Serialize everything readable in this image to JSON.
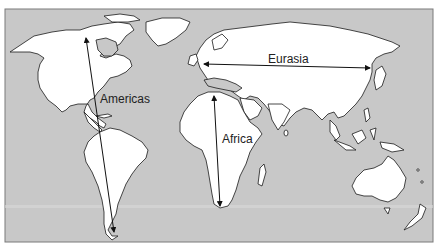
{
  "diagram": {
    "type": "world-map-continental-axes",
    "colors": {
      "ocean": "#c8c8c8",
      "land": "#ffffff",
      "coast": "#1a1a1a",
      "border": "#7a7a7a",
      "arrow": "#111111",
      "label": "#222222"
    },
    "axes": [
      {
        "id": "americas",
        "label": "Americas",
        "orientation": "north-south"
      },
      {
        "id": "eurasia",
        "label": "Eurasia",
        "orientation": "east-west"
      },
      {
        "id": "africa",
        "label": "Africa",
        "orientation": "north-south"
      }
    ]
  }
}
